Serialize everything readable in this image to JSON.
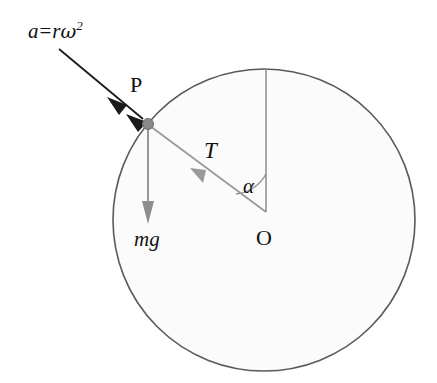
{
  "figure": {
    "kind": "physics-free-body-diagram",
    "caption_labels": {
      "point_on_rim": "P",
      "center": "O",
      "tension_force": "T",
      "angle": "α",
      "weight_force": "mg",
      "acceleration_expression": {
        "variable": "a",
        "equals": "=",
        "radius": "r",
        "omega": "ω",
        "exponent": "2",
        "full": "a = rω²"
      }
    },
    "colors": {
      "circle_stroke": "#5a5a5a",
      "circle_fill": "#fbfbfb",
      "vector_gray": "#8d8d8d",
      "vector_black": "#1a1a1a",
      "point_marker": "#8a8a8a",
      "text": "#111111",
      "background": "#ffffff"
    },
    "geometry": {
      "circle_center_x": 264,
      "circle_center_y": 220,
      "circle_radius": 151,
      "point_P_x": 148,
      "point_P_y": 124,
      "vertical_top_x": 266,
      "vertical_top_y": 69,
      "mg_arrow_end_x": 148,
      "mg_arrow_end_y": 223,
      "accel_arrow_start_x": 59,
      "accel_arrow_start_y": 49,
      "accel_arrow_end_x": 144,
      "accel_arrow_end_y": 120,
      "angle_arc_radius": 38
    }
  }
}
